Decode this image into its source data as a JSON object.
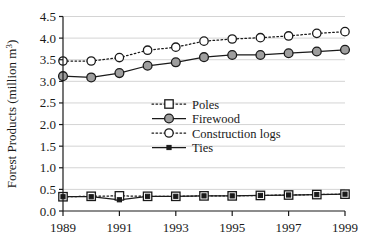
{
  "chart_data": {
    "type": "line",
    "title": "",
    "xlabel": "",
    "ylabel": "Forest Products (million m3)",
    "ylabel_main": "Forest Products (million m",
    "ylabel_sup": "3",
    "ylabel_close": ")",
    "x": [
      1989,
      1990,
      1991,
      1992,
      1993,
      1994,
      1995,
      1996,
      1997,
      1998,
      1999
    ],
    "xlim": [
      1989,
      1999
    ],
    "ylim": [
      0.0,
      4.5
    ],
    "grid": true,
    "legend_position": "center",
    "xtick_labels": [
      "1989",
      "1991",
      "1993",
      "1995",
      "1997",
      "1999"
    ],
    "xtick_values": [
      1989,
      1991,
      1993,
      1995,
      1997,
      1999
    ],
    "ytick_labels": [
      "0.0",
      "0.5",
      "1.0",
      "1.5",
      "2.0",
      "2.5",
      "3.0",
      "3.5",
      "4.0",
      "4.5"
    ],
    "ytick_values": [
      0.0,
      0.5,
      1.0,
      1.5,
      2.0,
      2.5,
      3.0,
      3.5,
      4.0,
      4.5
    ],
    "series": [
      {
        "name": "Poles",
        "marker": "open-square",
        "line": "dotted",
        "values": [
          0.33,
          0.34,
          0.35,
          0.34,
          0.34,
          0.35,
          0.35,
          0.36,
          0.37,
          0.38,
          0.39
        ]
      },
      {
        "name": "Firewood",
        "marker": "filled-circle",
        "line": "solid",
        "values": [
          3.12,
          3.09,
          3.19,
          3.36,
          3.44,
          3.56,
          3.61,
          3.61,
          3.65,
          3.69,
          3.73
        ]
      },
      {
        "name": "Construction logs",
        "marker": "open-circle",
        "line": "dotted",
        "values": [
          3.47,
          3.47,
          3.55,
          3.72,
          3.79,
          3.93,
          3.98,
          4.01,
          4.05,
          4.11,
          4.15
        ]
      },
      {
        "name": "Ties",
        "marker": "small-filled-square",
        "line": "solid",
        "values": [
          0.33,
          0.33,
          0.26,
          0.34,
          0.34,
          0.35,
          0.35,
          0.36,
          0.37,
          0.38,
          0.39
        ]
      }
    ]
  },
  "colors": {
    "axis": "#1a1a1a",
    "grid": "#cfcfcf",
    "marker_fill_gray": "#9e9e9e",
    "marker_fill_white": "#ffffff",
    "line": "#1a1a1a",
    "background": "#ffffff"
  },
  "legend": {
    "entries": [
      {
        "label": "Poles"
      },
      {
        "label": "Firewood"
      },
      {
        "label": "Construction logs"
      },
      {
        "label": "Ties"
      }
    ]
  }
}
